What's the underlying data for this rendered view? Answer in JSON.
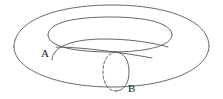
{
  "figure": {
    "name": "torus-with-cycles",
    "width": 223,
    "height": 99,
    "background_color": "#ffffff",
    "stroke_color": "#555555",
    "label_color": "#1a1a1a",
    "stroke_width": 0.9
  },
  "labels": {
    "cycle_a": "A",
    "cycle_b": "B"
  },
  "label_positions": {
    "cycle_a": {
      "x": 41,
      "y": 57
    },
    "cycle_b": {
      "x": 128,
      "y": 92
    }
  },
  "geometry": {
    "outer_ellipse": {
      "cx": 111.5,
      "cy": 46,
      "rx": 98,
      "ry": 41
    },
    "inner_hole_ellipse": {
      "cx": 110,
      "cy": 34,
      "rx": 62,
      "ry": 17
    },
    "outer_rim_top_arc": "M 14 47 C 14 20 58 5 112 5 C 166 5 209 20 209 46",
    "outer_rim_bottom_arc": "M 14 47 C 14 70 58 87 112 87 C 166 87 209 70 209 46",
    "hole_upper_arc": "M 48 35 C 48 22 76 17 111 17 C 146 17 172 23 172 35",
    "hole_lower_arc": "M 48 35 C 48 47 76 52 111 52 C 146 52 172 46 172 35",
    "cycle_a_curve_left": "M 52 60 C 52 46 74 39 104 39 C 128 39 150 42 168 47",
    "cycle_a_curve_right": "M 56 47 C 80 47 120 52 152 58",
    "cycle_b_circle": {
      "cx": 116,
      "cy": 72,
      "rx": 13,
      "ry": 20
    },
    "cycle_b_front_arc": "M 116 52 C 125 53 129 61 129 72 C 129 83 124 91 116 91",
    "cycle_b_back_arc_dashed": "M 116 52 C 107 53 103 61 103 72 C 103 83 108 91 116 91"
  },
  "style": {
    "dash_pattern": "3 2"
  }
}
